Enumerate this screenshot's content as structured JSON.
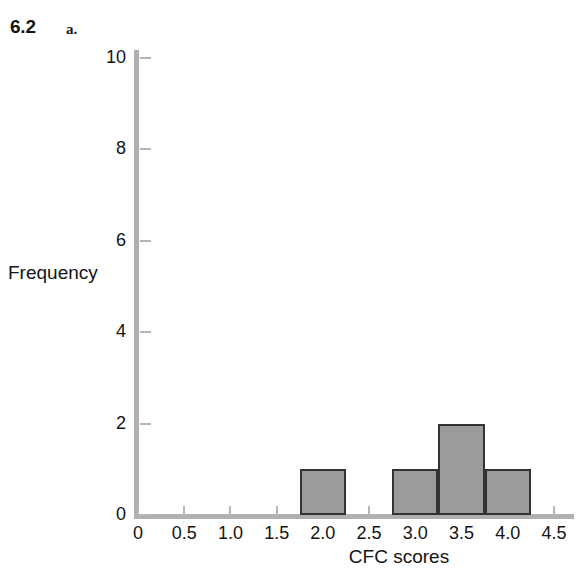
{
  "figure": {
    "number": "6.2",
    "part": "a."
  },
  "chart_data": {
    "type": "bar",
    "title": "",
    "subtitle": "",
    "xlabel": "CFC scores",
    "ylabel": "Frequency",
    "xlim": [
      0,
      4.5
    ],
    "ylim": [
      0,
      10
    ],
    "grid": false,
    "legend": null,
    "x_ticks": [
      "0",
      "0.5",
      "1.0",
      "1.5",
      "2.0",
      "2.5",
      "3.0",
      "3.5",
      "4.0",
      "4.5"
    ],
    "x_tick_values": [
      0,
      0.5,
      1.0,
      1.5,
      2.0,
      2.5,
      3.0,
      3.5,
      4.0,
      4.5
    ],
    "y_ticks": [
      "0",
      "2",
      "4",
      "6",
      "8",
      "10"
    ],
    "y_tick_values": [
      0,
      2,
      4,
      6,
      8,
      10
    ],
    "bin_width": 0.5,
    "bins": [
      {
        "start": 1.75,
        "end": 2.25,
        "value": 1
      },
      {
        "start": 2.75,
        "end": 3.25,
        "value": 1
      },
      {
        "start": 3.25,
        "end": 3.75,
        "value": 2
      },
      {
        "start": 3.75,
        "end": 4.25,
        "value": 1
      }
    ],
    "categories": [
      "1.75-2.25",
      "2.75-3.25",
      "3.25-3.75",
      "3.75-4.25"
    ],
    "values": [
      1,
      1,
      2,
      1
    ],
    "colors": {
      "bar_fill": "#9b9b9b",
      "bar_edge": "#333333",
      "axis": "#b0b0b0",
      "text": "#141414",
      "background": "#ffffff"
    }
  }
}
